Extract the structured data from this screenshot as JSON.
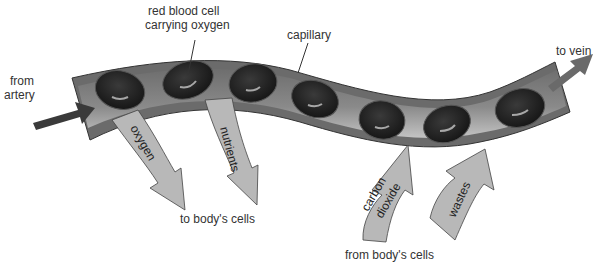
{
  "diagram": {
    "labels": {
      "rbc_line1": "red blood cell",
      "rbc_line2": "carrying oxygen",
      "capillary": "capillary",
      "from_artery_line1": "from",
      "from_artery_line2": "artery",
      "to_vein": "to vein",
      "to_body_cells": "to body's cells",
      "from_body_cells": "from body's cells"
    },
    "arrows": {
      "oxygen": "oxygen",
      "nutrients": "nutrients",
      "carbon_line1": "carbon",
      "carbon_line2": "dioxide",
      "wastes": "wastes"
    },
    "colors": {
      "vessel_wall": "#6b6b6b",
      "vessel_lumen_dark": "#7a7a7a",
      "vessel_lumen_light": "#b5b5b5",
      "cell": "#1e1e1e",
      "exchange_arrow": "#b8b8b8",
      "flow_arrow": "#3a3a3a"
    }
  }
}
